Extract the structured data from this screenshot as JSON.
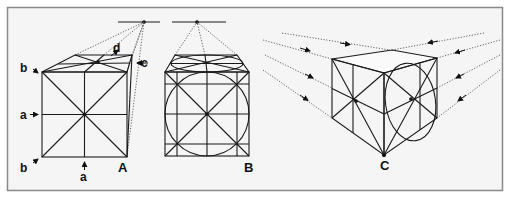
{
  "figure": {
    "colors": {
      "background": "#f4f4f4",
      "frame": "#8a8a8a",
      "line": "#1a1a1a",
      "dotted": "#555555"
    },
    "panels": [
      {
        "id": "A",
        "label": "A",
        "type": "one-point perspective cube, viewed from side"
      },
      {
        "id": "B",
        "label": "B",
        "type": "one-point perspective cube with inscribed circle"
      },
      {
        "id": "C",
        "label": "C",
        "type": "two-point perspective cube with inscribed circle"
      }
    ],
    "annotations": {
      "a_left": "a",
      "a_bottom": "a",
      "b_top": "b",
      "b_bottom": "b",
      "c": "c",
      "d": "d"
    },
    "labels": {
      "A": "A",
      "B": "B",
      "C": "C"
    }
  }
}
